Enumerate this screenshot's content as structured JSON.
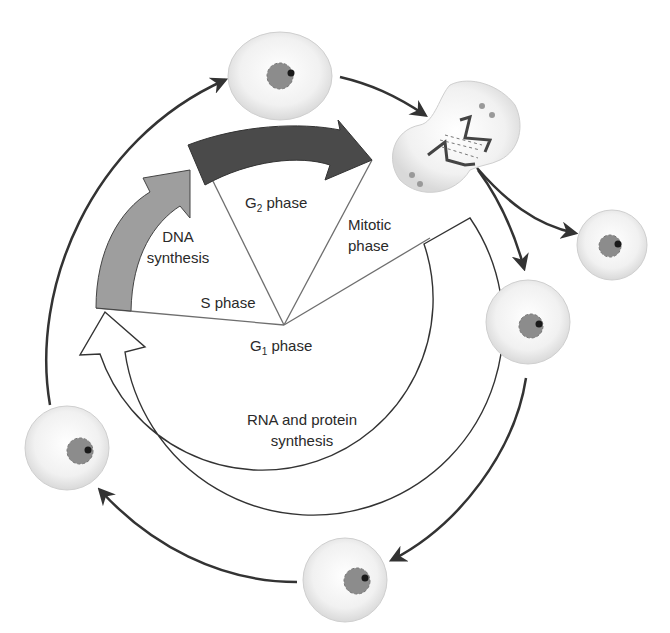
{
  "labels": {
    "dna": "DNA",
    "synthesis": "synthesis",
    "s_phase": "S phase",
    "g2_prefix": "G",
    "g2_sub": "2",
    "g2_suffix": " phase",
    "mitotic": "Mitotic",
    "mitotic_phase": "phase",
    "g1_prefix": "G",
    "g1_sub": "1",
    "g1_suffix": " phase",
    "rna_line1": "RNA and protein",
    "rna_line2": "synthesis"
  },
  "colors": {
    "s_arrow": "#9e9e9e",
    "g2_arrow": "#4a4a4a",
    "g1_arrow": "#ffffff",
    "cycle_arrow": "#333333",
    "cell_fill": "#f2f2f2",
    "nucleus": "#8c8c8c",
    "nucleolus": "#1a1a1a"
  },
  "cells": [
    {
      "name": "cell-top",
      "cx": 280,
      "cy": 76,
      "rx": 52,
      "ry": 44
    },
    {
      "name": "cell-daughter-right",
      "cx": 612,
      "cy": 245,
      "r": 35
    },
    {
      "name": "cell-daughter-lower",
      "cx": 528,
      "cy": 322,
      "r": 42
    },
    {
      "name": "cell-bottom",
      "cx": 345,
      "cy": 580,
      "r": 42
    },
    {
      "name": "cell-left",
      "cx": 67,
      "cy": 448,
      "r": 42
    }
  ]
}
